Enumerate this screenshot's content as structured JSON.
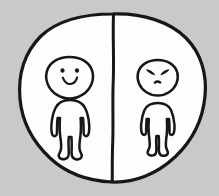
{
  "image": {
    "kind": "hand-drawn-illustration",
    "title": "Two figures divided by a line inside a circle",
    "background_color": "#c9c9c9",
    "paper_color": "#fdfdfd",
    "ink_color": "#171717",
    "width": 219,
    "height": 196
  },
  "scene": {
    "circle": {
      "name": "enclosing circle",
      "stroke_width": 3.2,
      "center_x": 112,
      "center_y": 98,
      "radius_x": 93,
      "radius_y": 85
    },
    "divider": {
      "name": "vertical dividing line",
      "stroke_width": 3.0,
      "x_top": 113,
      "y_top": 14,
      "x_bottom": 112,
      "y_bottom": 182
    },
    "figures": [
      {
        "id": "left-figure",
        "side": "left",
        "mood": "happy",
        "expression": "smiling",
        "eyes": "two round dots",
        "mouth": "upward curved smile",
        "relative_size": "larger",
        "center_x": 69,
        "center_y": 93,
        "head_radius_x": 24,
        "head_radius_y": 21
      },
      {
        "id": "right-figure",
        "side": "right",
        "mood": "angry",
        "expression": "frowning",
        "eyes": "two slanted angry slashes",
        "mouth": "small downward frown",
        "relative_size": "smaller",
        "center_x": 156,
        "center_y": 93,
        "head_radius_x": 21,
        "head_radius_y": 19
      }
    ]
  }
}
